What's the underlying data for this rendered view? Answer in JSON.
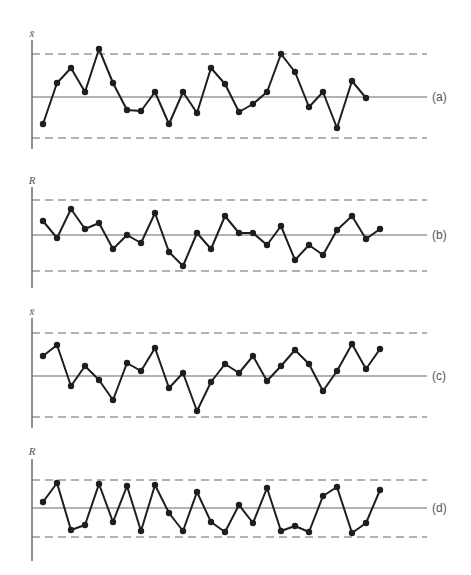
{
  "chart_data": [
    {
      "type": "line",
      "panel_label": "(a)",
      "ylabel": "x̄",
      "title": "",
      "xlabel": "",
      "grid": false,
      "control_limits": {
        "UCL": 54,
        "CL": 97,
        "LCL": 138
      },
      "axis": {
        "x": 32,
        "y_top": 40,
        "y_bottom": 149
      },
      "label_y": 33,
      "x": [
        43,
        57,
        71,
        85,
        99,
        113,
        127,
        141,
        155,
        169,
        183,
        197,
        211,
        225,
        239,
        253,
        267,
        281,
        295,
        309,
        323,
        337,
        352,
        366
      ],
      "y_pixels": [
        124,
        83,
        68,
        92,
        49,
        83,
        110,
        111,
        92,
        124,
        92,
        113,
        68,
        84,
        112,
        104,
        92,
        54,
        72,
        107,
        92,
        128,
        81,
        98
      ],
      "values_relative_to_cl": [
        -0.63,
        0.33,
        0.7,
        0.12,
        1.12,
        0.33,
        -0.3,
        -0.33,
        0.12,
        -0.63,
        0.12,
        -0.37,
        0.7,
        0.3,
        -0.35,
        -0.17,
        0.12,
        1.0,
        0.6,
        -0.23,
        0.12,
        -0.75,
        0.37,
        -0.02
      ]
    },
    {
      "type": "line",
      "panel_label": "(b)",
      "ylabel": "R",
      "title": "",
      "xlabel": "",
      "grid": false,
      "control_limits": {
        "UCL": 200,
        "CL": 235,
        "LCL": 271
      },
      "axis": {
        "x": 32,
        "y_top": 187,
        "y_bottom": 288
      },
      "label_y": 180,
      "x": [
        43,
        57,
        71,
        85,
        99,
        113,
        127,
        141,
        155,
        169,
        183,
        197,
        211,
        225,
        239,
        253,
        267,
        281,
        295,
        309,
        323,
        337,
        352,
        366,
        380
      ],
      "y_pixels": [
        221,
        238,
        209,
        229,
        223,
        249,
        235,
        243,
        213,
        252,
        266,
        233,
        249,
        216,
        233,
        233,
        245,
        226,
        260,
        245,
        255,
        230,
        216,
        239,
        229
      ],
      "values_relative_to_cl": [
        0.4,
        -0.09,
        0.74,
        0.17,
        0.34,
        -0.4,
        0.0,
        -0.23,
        0.63,
        -0.49,
        -0.89,
        0.06,
        -0.4,
        0.54,
        0.06,
        0.06,
        -0.29,
        0.26,
        -0.71,
        -0.29,
        -0.57,
        0.14,
        0.54,
        -0.11,
        0.17
      ]
    },
    {
      "type": "line",
      "panel_label": "(c)",
      "ylabel": "x̄",
      "title": "",
      "xlabel": "",
      "grid": false,
      "control_limits": {
        "UCL": 333,
        "CL": 376,
        "LCL": 417
      },
      "axis": {
        "x": 32,
        "y_top": 318,
        "y_bottom": 428
      },
      "label_y": 311,
      "x": [
        43,
        57,
        71,
        85,
        99,
        113,
        127,
        141,
        155,
        169,
        183,
        197,
        211,
        225,
        239,
        253,
        267,
        281,
        295,
        309,
        323,
        337,
        352,
        366,
        380
      ],
      "y_pixels": [
        356,
        345,
        386,
        366,
        380,
        400,
        363,
        371,
        348,
        388,
        373,
        411,
        382,
        364,
        373,
        356,
        381,
        366,
        350,
        364,
        391,
        371,
        344,
        369,
        349
      ],
      "values_relative_to_cl": [
        0.47,
        0.72,
        -0.24,
        0.23,
        -0.1,
        -0.57,
        0.3,
        0.12,
        0.65,
        -0.29,
        0.07,
        -0.85,
        -0.15,
        0.28,
        0.07,
        0.47,
        -0.12,
        0.23,
        0.6,
        0.28,
        -0.36,
        0.12,
        0.74,
        0.16,
        0.63
      ]
    },
    {
      "type": "line",
      "panel_label": "(d)",
      "ylabel": "R",
      "title": "",
      "xlabel": "",
      "grid": false,
      "control_limits": {
        "UCL": 480,
        "CL": 508,
        "LCL": 537
      },
      "axis": {
        "x": 32,
        "y_top": 459,
        "y_bottom": 561
      },
      "label_y": 451,
      "x": [
        43,
        57,
        71,
        85,
        99,
        113,
        127,
        141,
        155,
        169,
        183,
        197,
        211,
        225,
        239,
        253,
        267,
        281,
        295,
        309,
        323,
        337,
        352,
        366,
        380
      ],
      "y_pixels": [
        502,
        483,
        530,
        525,
        484,
        522,
        486,
        531,
        485,
        513,
        531,
        492,
        522,
        532,
        505,
        523,
        488,
        531,
        526,
        532,
        496,
        487,
        533,
        523,
        490
      ],
      "values_relative_to_cl": [
        0.21,
        0.89,
        -0.76,
        -0.59,
        0.86,
        -0.48,
        0.79,
        -0.79,
        0.82,
        -0.17,
        -0.79,
        0.57,
        -0.48,
        -0.83,
        0.1,
        -0.52,
        0.71,
        -0.79,
        -0.62,
        -0.83,
        0.43,
        0.75,
        -0.86,
        -0.52,
        0.64
      ]
    }
  ],
  "layout": {
    "line_x_start": 32,
    "line_x_end": 427,
    "panel_label_x": 432
  },
  "colors": {
    "series": "#1e1e1e",
    "reference_lines": "#666666",
    "axis": "#555555",
    "label_text": "#555555",
    "background": "#ffffff"
  }
}
